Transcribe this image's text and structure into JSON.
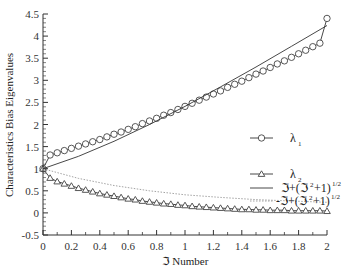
{
  "chart_data": {
    "type": "line",
    "title": "",
    "xlabel": "ℑ Number",
    "ylabel": "Characteristics Bias Eigenvalues",
    "xlim": [
      0,
      2
    ],
    "ylim": [
      -0.5,
      4.5
    ],
    "grid": false,
    "legend_position": "center-right",
    "x_ticks": [
      "0",
      "0.2",
      "0.4",
      "0.6",
      "0.8",
      "1",
      "1.2",
      "1.4",
      "1.6",
      "1.8",
      "2"
    ],
    "y_ticks": [
      "-0.5",
      "0",
      "0.5",
      "1",
      "1.5",
      "2",
      "2.5",
      "3",
      "3.5",
      "4",
      "4.5"
    ],
    "series": [
      {
        "name": "λ1",
        "legend_label": "λ",
        "legend_sub": "1",
        "style": "line-circle-markers",
        "x": [
          0,
          0.05,
          0.1,
          0.15,
          0.2,
          0.25,
          0.3,
          0.35,
          0.4,
          0.45,
          0.5,
          0.55,
          0.6,
          0.65,
          0.7,
          0.75,
          0.8,
          0.85,
          0.9,
          0.95,
          1.0,
          1.05,
          1.1,
          1.15,
          1.2,
          1.25,
          1.3,
          1.35,
          1.4,
          1.45,
          1.5,
          1.55,
          1.6,
          1.65,
          1.7,
          1.75,
          1.8,
          1.85,
          1.9,
          1.95,
          2.0
        ],
        "values": [
          1.0,
          1.31,
          1.36,
          1.41,
          1.46,
          1.51,
          1.56,
          1.61,
          1.66,
          1.72,
          1.78,
          1.83,
          1.89,
          1.95,
          2.02,
          2.08,
          2.14,
          2.21,
          2.27,
          2.34,
          2.41,
          2.48,
          2.55,
          2.62,
          2.69,
          2.76,
          2.84,
          2.91,
          2.98,
          3.06,
          3.14,
          3.21,
          3.29,
          3.37,
          3.44,
          3.52,
          3.6,
          3.68,
          3.76,
          3.84,
          4.4
        ]
      },
      {
        "name": "λ2",
        "legend_label": "λ",
        "legend_sub": "2",
        "style": "line-triangle-markers",
        "x": [
          0,
          0.05,
          0.1,
          0.15,
          0.2,
          0.25,
          0.3,
          0.35,
          0.4,
          0.45,
          0.5,
          0.55,
          0.6,
          0.65,
          0.7,
          0.75,
          0.8,
          0.85,
          0.9,
          0.95,
          1.0,
          1.05,
          1.1,
          1.15,
          1.2,
          1.25,
          1.3,
          1.35,
          1.4,
          1.45,
          1.5,
          1.55,
          1.6,
          1.65,
          1.7,
          1.75,
          1.8,
          1.85,
          1.9,
          1.95,
          2.0
        ],
        "values": [
          1.0,
          0.79,
          0.71,
          0.66,
          0.61,
          0.56,
          0.52,
          0.48,
          0.44,
          0.41,
          0.38,
          0.35,
          0.32,
          0.3,
          0.27,
          0.25,
          0.23,
          0.21,
          0.2,
          0.18,
          0.17,
          0.15,
          0.14,
          0.13,
          0.12,
          0.11,
          0.1,
          0.09,
          0.08,
          0.08,
          0.07,
          0.07,
          0.06,
          0.06,
          0.06,
          0.05,
          0.05,
          0.05,
          0.05,
          0.05,
          0.04
        ]
      },
      {
        "name": "ℑ+(ℑ²+1)^1/2",
        "legend_label": "ℑ+(ℑ",
        "legend_tail": "+1)",
        "legend_sup": "2",
        "legend_exp": "1/2",
        "style": "solid",
        "x": [
          0,
          0.25,
          0.5,
          0.75,
          1.0,
          1.25,
          1.5,
          1.75,
          2.0
        ],
        "values": [
          1.0,
          1.28,
          1.62,
          2.0,
          2.41,
          2.85,
          3.3,
          3.77,
          4.24
        ]
      },
      {
        "name": "-ℑ+(ℑ²+1)^1/2",
        "legend_label": "-ℑ+(ℑ",
        "legend_tail": "+1)",
        "legend_sup": "2",
        "legend_exp": "1/2",
        "style": "dotted",
        "x": [
          0,
          0.25,
          0.5,
          0.75,
          1.0,
          1.25,
          1.5,
          1.75,
          2.0
        ],
        "values": [
          1.0,
          0.78,
          0.62,
          0.5,
          0.41,
          0.35,
          0.3,
          0.27,
          0.24
        ]
      }
    ]
  }
}
